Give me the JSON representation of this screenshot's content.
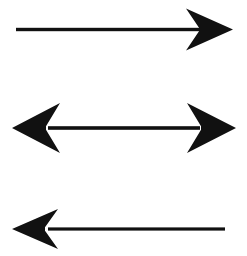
{
  "figure": {
    "width": 247,
    "height": 256,
    "background_color": "#ffffff",
    "ink_color": "#111111",
    "arrow_count": 3
  },
  "arrows": [
    {
      "id": "arrow-top",
      "name": "rightward-arrow",
      "direction": "right",
      "heads": 1,
      "label": "Rightward arrow",
      "shaft": {
        "x1": 16,
        "x2": 200,
        "y": 29.5,
        "thickness": 3.4
      },
      "head_right": {
        "tip_x": 233,
        "center_y": 29.5,
        "back_x": 186,
        "barb_half_height": 21,
        "notch_x": 199
      }
    },
    {
      "id": "arrow-middle",
      "name": "bidirectional-arrow",
      "direction": "both",
      "heads": 2,
      "label": "Double-headed arrow",
      "shaft": {
        "x1": 48,
        "x2": 200,
        "y": 128,
        "thickness": 3.6
      },
      "head_left": {
        "tip_x": 12,
        "center_y": 128,
        "back_x": 60,
        "barb_half_height": 25,
        "notch_x": 46
      },
      "head_right": {
        "tip_x": 236,
        "center_y": 128,
        "back_x": 187,
        "barb_half_height": 25,
        "notch_x": 201
      }
    },
    {
      "id": "arrow-bottom",
      "name": "leftward-arrow",
      "direction": "left",
      "heads": 1,
      "label": "Leftward arrow",
      "shaft": {
        "x1": 48,
        "x2": 225,
        "y": 229,
        "thickness": 3.2
      },
      "head_left": {
        "tip_x": 12,
        "center_y": 229,
        "back_x": 58,
        "barb_half_height": 20,
        "notch_x": 45
      }
    }
  ]
}
